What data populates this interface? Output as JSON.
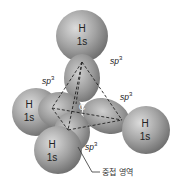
{
  "diagram": {
    "center_atom": "C",
    "hydrogens": [
      {
        "id": "top",
        "symbol": "H",
        "orbital": "1s",
        "cx": 82,
        "cy": 38,
        "r": 26
      },
      {
        "id": "left",
        "symbol": "H",
        "orbital": "1s",
        "cx": 36,
        "cy": 112,
        "r": 24
      },
      {
        "id": "bottom",
        "symbol": "H",
        "orbital": "1s",
        "cx": 58,
        "cy": 148,
        "r": 24
      },
      {
        "id": "right",
        "symbol": "H",
        "orbital": "1s",
        "cx": 148,
        "cy": 130,
        "r": 24
      }
    ],
    "sp3_labels": [
      {
        "text": "sp",
        "sup": "3",
        "x": 110,
        "y": 64
      },
      {
        "text": "sp",
        "sup": "3",
        "x": 42,
        "y": 84
      },
      {
        "text": "sp",
        "sup": "3",
        "x": 120,
        "y": 100
      },
      {
        "text": "sp",
        "sup": "3",
        "x": 85,
        "y": 150
      }
    ],
    "overlap_label": "중첩 영역",
    "colors": {
      "sphere": "#9a9a9a",
      "sphere_light": "#d8d8d8",
      "sphere_dark": "#6e6e6e",
      "line": "#222222"
    }
  }
}
